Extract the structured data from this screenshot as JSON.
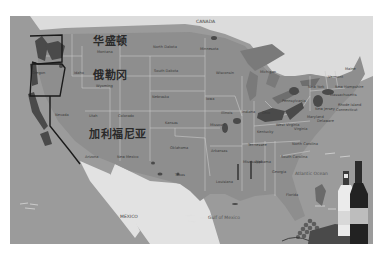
{
  "map": {
    "title_labels": {
      "washington_cn": "华盛顿",
      "oregon_cn": "俄勒冈",
      "california_cn": "加利福尼亚"
    },
    "countries": {
      "canada": "CANADA",
      "mexico": "MEXICO"
    },
    "water": {
      "atlantic": "Atlantic Ocean",
      "gulf": "Gulf of Mexico"
    },
    "states": {
      "washington": "Washington",
      "oregon": "Oregon",
      "idaho": "Idaho",
      "montana": "Montana",
      "wyoming": "Wyoming",
      "nevada": "Nevada",
      "utah": "Utah",
      "colorado": "Colorado",
      "arizona": "Arizona",
      "new_mexico": "New Mexico",
      "north_dakota": "North Dakota",
      "south_dakota": "South Dakota",
      "nebraska": "Nebraska",
      "kansas": "Kansas",
      "oklahoma": "Oklahoma",
      "texas": "Texas",
      "minnesota": "Minnesota",
      "iowa": "Iowa",
      "missouri": "Missouri",
      "arkansas": "Arkansas",
      "louisiana": "Louisiana",
      "wisconsin": "Wisconsin",
      "illinois": "Illinois",
      "michigan": "Michigan",
      "indiana": "Indiana",
      "ohio": "Ohio",
      "kentucky": "Kentucky",
      "tennessee": "Tennessee",
      "mississippi": "Mississippi",
      "alabama": "Alabama",
      "georgia": "Georgia",
      "florida": "Florida",
      "south_carolina": "South Carolina",
      "north_carolina": "North Carolina",
      "virginia": "Virginia",
      "west_virginia": "West Virginia",
      "pennsylvania": "Pennsylvania",
      "new_york": "New York",
      "vermont": "Vermont",
      "new_hampshire": "New Hampshire",
      "maine": "Maine",
      "massachusetts": "Massachusetts",
      "rhode_island": "Rhode Island",
      "connecticut": "Connecticut",
      "new_jersey": "New Jersey",
      "maryland": "Maryland",
      "delaware": "Delaware"
    },
    "colors": {
      "land": "#8e8e8e",
      "ocean": "#9b9b9b",
      "canada": "#dcdcdc",
      "mexico": "#e2e2e2",
      "wine_region": "#4a4a4a",
      "border": "#c9c9c9",
      "highlight_border": "#1a1a1a"
    }
  }
}
